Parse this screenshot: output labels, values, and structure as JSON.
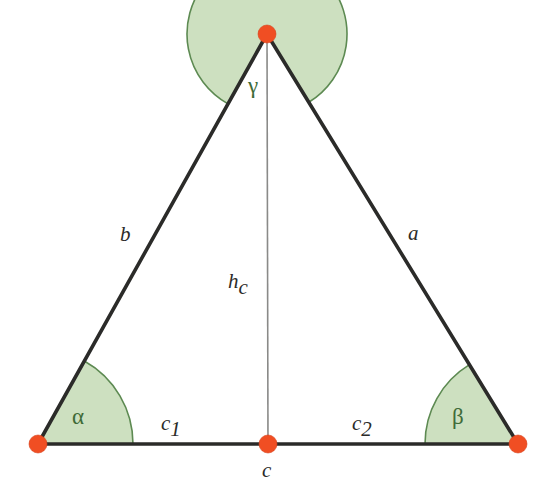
{
  "figure": {
    "background_color": "#ffffff"
  },
  "colors": {
    "vertex_dot": "#f04e23",
    "sector_fill": "#cde0c0",
    "sector_arc": "#5d8a52",
    "triangle_side": "#2b2b29",
    "altitude": "#8a8a88",
    "greek_text": "#3f6b38",
    "latin_text": "#2b2b29"
  },
  "vertices": {
    "apex": {
      "name": "apex-vertex",
      "x": 267,
      "y": 34
    },
    "bottom_left": {
      "name": "bottom-left-vertex",
      "x": 38,
      "y": 444
    },
    "bottom_right": {
      "name": "bottom-right-vertex",
      "x": 518,
      "y": 444
    },
    "altitude_foot": {
      "name": "altitude-foot-vertex",
      "x": 268,
      "y": 444
    }
  },
  "labels": {
    "side_b": "b",
    "side_a": "a",
    "altitude_base": "h",
    "altitude_sub": "c",
    "segment_c1_base": "c",
    "segment_c1_sub": "1",
    "segment_c2_base": "c",
    "segment_c2_sub": "2",
    "base_c": "c",
    "angle_alpha": "α",
    "angle_beta": "β",
    "angle_gamma": "γ"
  },
  "label_positions": {
    "side_b": {
      "x": 120,
      "y": 241
    },
    "side_a": {
      "x": 408,
      "y": 240
    },
    "altitude": {
      "x": 228,
      "y": 288
    },
    "segment_c1": {
      "x": 161,
      "y": 430
    },
    "segment_c2": {
      "x": 352,
      "y": 430
    },
    "base_c": {
      "x": 262,
      "y": 477
    },
    "angle_alpha": {
      "x": 72,
      "y": 424
    },
    "angle_beta": {
      "x": 452,
      "y": 424
    },
    "angle_gamma": {
      "x": 248,
      "y": 93
    }
  },
  "sectors": {
    "alpha": {
      "vertex": "bottom_left",
      "radius": 95
    },
    "beta": {
      "vertex": "bottom_right",
      "radius": 93
    },
    "gamma": {
      "vertex": "apex",
      "radius": 80
    }
  },
  "geometry": {
    "vertex_dot_radius": 9,
    "side_stroke_width": 3.6,
    "altitude_stroke_width": 1.6,
    "arc_stroke_width": 1.6
  }
}
